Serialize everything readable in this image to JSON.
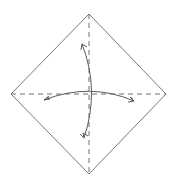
{
  "diagram": {
    "type": "origami-fold-diagram",
    "colors": {
      "background": "#ffffff",
      "outline": "#7a7a7a",
      "valley_fold": "#6e6e6e",
      "arrow": "#5a5a5a"
    },
    "paper": {
      "shape": "square-rotated-45",
      "vertices": {
        "top": [
          89,
          14
        ],
        "right": [
          166,
          94
        ],
        "bottom": [
          89,
          174
        ],
        "left": [
          11,
          94
        ]
      }
    },
    "fold_lines": [
      {
        "name": "vertical-diagonal",
        "style": "dashed",
        "from": [
          89,
          14
        ],
        "to": [
          89,
          174
        ]
      },
      {
        "name": "horizontal-diagonal",
        "style": "dashed",
        "from": [
          11,
          94
        ],
        "to": [
          166,
          94
        ]
      }
    ],
    "arrows": [
      {
        "name": "vertical-fold-unfold-arrow",
        "from": [
          82,
          44
        ],
        "to": [
          84,
          138
        ],
        "curve_via": [
          96,
          90
        ],
        "heads": "both"
      },
      {
        "name": "horizontal-fold-unfold-arrow",
        "from": [
          44,
          100
        ],
        "to": [
          134,
          101
        ],
        "curve_via": [
          90,
          84
        ],
        "heads": "both"
      }
    ]
  }
}
